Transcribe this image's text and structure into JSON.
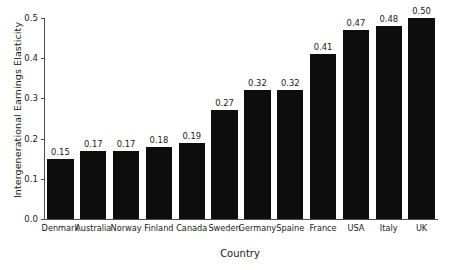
{
  "chart_data": {
    "type": "bar",
    "title": "",
    "xlabel": "Country",
    "ylabel": "Intergenerational Earnings Elasticity",
    "categories": [
      "Denmark",
      "Australia",
      "Norway",
      "Finland",
      "Canada",
      "Sweden",
      "Germany",
      "Spaine",
      "France",
      "USA",
      "Italy",
      "UK"
    ],
    "values": [
      0.15,
      0.17,
      0.17,
      0.18,
      0.19,
      0.27,
      0.32,
      0.32,
      0.41,
      0.47,
      0.48,
      0.5
    ],
    "value_labels": [
      "0.15",
      "0.17",
      "0.17",
      "0.18",
      "0.19",
      "0.27",
      "0.32",
      "0.32",
      "0.41",
      "0.47",
      "0.48",
      "0.50"
    ],
    "ylim": [
      0.0,
      0.5
    ],
    "yticks": [
      0.0,
      0.1,
      0.2,
      0.3,
      0.4,
      0.5
    ],
    "ytick_labels": [
      "0.0",
      "0.1",
      "0.2",
      "0.3",
      "0.4",
      "0.5"
    ],
    "grid": false,
    "legend": "none",
    "bar_color": "#0d0d0d",
    "background_color": "#ffffff",
    "axis_color": "#4d4d4d"
  }
}
